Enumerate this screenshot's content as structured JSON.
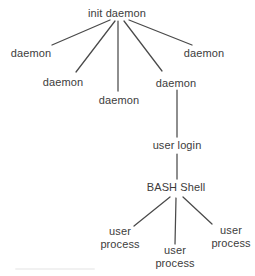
{
  "diagram": {
    "type": "process-tree",
    "nodes": [
      {
        "id": "init-daemon",
        "label": "init daemon"
      },
      {
        "id": "daemon-1",
        "label": "daemon"
      },
      {
        "id": "daemon-2",
        "label": "daemon"
      },
      {
        "id": "daemon-3",
        "label": "daemon"
      },
      {
        "id": "daemon-4",
        "label": "daemon"
      },
      {
        "id": "daemon-5",
        "label": "daemon"
      },
      {
        "id": "user-login",
        "label": "user login"
      },
      {
        "id": "bash-shell",
        "label": "BASH Shell"
      },
      {
        "id": "user-process-1",
        "label": "user\nprocess"
      },
      {
        "id": "user-process-2",
        "label": "user\nprocess"
      },
      {
        "id": "user-process-3",
        "label": "user\nprocess"
      }
    ],
    "edges": [
      {
        "from": "init-daemon",
        "to": "daemon-1"
      },
      {
        "from": "init-daemon",
        "to": "daemon-2"
      },
      {
        "from": "init-daemon",
        "to": "daemon-3"
      },
      {
        "from": "init-daemon",
        "to": "daemon-4"
      },
      {
        "from": "init-daemon",
        "to": "daemon-5"
      },
      {
        "from": "daemon-4",
        "to": "user-login"
      },
      {
        "from": "user-login",
        "to": "bash-shell"
      },
      {
        "from": "bash-shell",
        "to": "user-process-1"
      },
      {
        "from": "bash-shell",
        "to": "user-process-2"
      },
      {
        "from": "bash-shell",
        "to": "user-process-3"
      }
    ],
    "colors": {
      "text": "#3c3c3c",
      "line": "#4a4a4a",
      "background": "#ffffff"
    }
  }
}
